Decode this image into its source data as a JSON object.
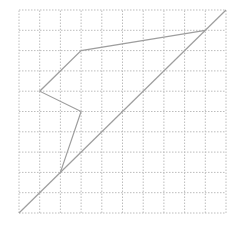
{
  "diagram": {
    "type": "grid-polyline",
    "grid": {
      "cols": 10,
      "rows": 10,
      "origin_px": [
        19,
        213
      ],
      "cell_w": 20.7,
      "cell_h": 20.3,
      "line_color": "#bdbdbd",
      "dash": "1.5,1.5"
    },
    "diagonal": {
      "from": [
        0,
        0
      ],
      "to": [
        10,
        10
      ],
      "color": "#9e9e9e"
    },
    "polyline": {
      "points": [
        [
          2,
          2
        ],
        [
          3,
          5
        ],
        [
          1,
          6
        ],
        [
          3,
          8
        ],
        [
          9,
          9
        ]
      ],
      "color": "#9e9e9e"
    }
  }
}
